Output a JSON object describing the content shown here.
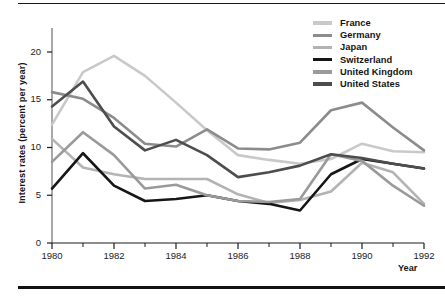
{
  "chart_data": {
    "type": "line",
    "title": "",
    "xlabel": "Year",
    "ylabel": "Interest rates (percent per year)",
    "xlim": [
      1980,
      1992
    ],
    "ylim": [
      0,
      22
    ],
    "xticks": [
      1980,
      1982,
      1984,
      1986,
      1988,
      1990,
      1992
    ],
    "xtick_labels": [
      "1980",
      "1982",
      "1984",
      "1986",
      "1988",
      "1990",
      "1992"
    ],
    "minor_xticks": [
      1981,
      1983,
      1985,
      1987,
      1989,
      1991
    ],
    "yticks": [
      0,
      5,
      10,
      15,
      20
    ],
    "ytick_labels": [
      "0",
      "5",
      "10",
      "15",
      "20"
    ],
    "grid": false,
    "legend_position": "top-right",
    "x": [
      1980,
      1981,
      1982,
      1983,
      1984,
      1985,
      1986,
      1987,
      1988,
      1989,
      1990,
      1991,
      1992
    ],
    "series": [
      {
        "name": "France",
        "color": "#c9c9c9",
        "values": [
          12.4,
          17.9,
          19.6,
          17.5,
          14.7,
          11.8,
          9.2,
          8.7,
          8.3,
          8.8,
          10.4,
          9.6,
          9.5
        ]
      },
      {
        "name": "Germany",
        "color": "#8c8c8c",
        "values": [
          15.8,
          15.1,
          13.1,
          10.4,
          10.1,
          11.9,
          9.9,
          9.8,
          10.5,
          13.9,
          14.7,
          12.1,
          9.7
        ]
      },
      {
        "name": "Japan",
        "color": "#b3b3b3",
        "values": [
          10.9,
          7.9,
          7.2,
          6.7,
          6.7,
          6.7,
          5.1,
          4.2,
          4.5,
          5.4,
          8.4,
          7.4,
          4.1
        ]
      },
      {
        "name": "Switzerland",
        "color": "#161616",
        "values": [
          5.7,
          9.4,
          6.0,
          4.4,
          4.6,
          5.0,
          4.4,
          4.1,
          3.4,
          7.2,
          8.8,
          8.3,
          7.8
        ]
      },
      {
        "name": "United Kingdom",
        "color": "#9a9a9a",
        "values": [
          8.5,
          11.6,
          9.2,
          5.7,
          6.1,
          5.0,
          4.4,
          4.3,
          4.6,
          9.3,
          8.6,
          6.0,
          3.9
        ]
      },
      {
        "name": "United States",
        "color": "#4d4d4d",
        "values": [
          14.3,
          16.9,
          12.2,
          9.7,
          10.8,
          9.2,
          6.9,
          7.4,
          8.1,
          9.3,
          8.9,
          8.3,
          7.8
        ]
      }
    ]
  },
  "axes": {
    "y_title": "Interest rates (percent per year)",
    "x_title": "Year"
  },
  "legend": {
    "items": [
      {
        "label": "France"
      },
      {
        "label": "Germany"
      },
      {
        "label": "Japan"
      },
      {
        "label": "Switzerland"
      },
      {
        "label": "United Kingdom"
      },
      {
        "label": "United States"
      }
    ]
  }
}
